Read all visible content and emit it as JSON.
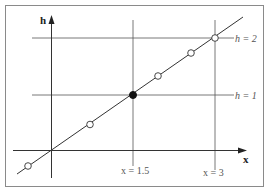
{
  "diagram": {
    "axes": {
      "y_label": "h",
      "x_label": "x"
    },
    "horizontal_lines": [
      {
        "label": "h = 2",
        "value": 2
      },
      {
        "label": "h = 1",
        "value": 1
      }
    ],
    "vertical_lines": [
      {
        "label": "x = 1.5",
        "value": 1.5
      },
      {
        "label": "x = 3",
        "value": 3
      }
    ],
    "line": {
      "description": "straight line h = x/1.5 through origin"
    },
    "points": {
      "filled": [
        {
          "x": 1.5,
          "h": 1
        }
      ],
      "open": [
        {
          "x": -0.4,
          "h": -0.27
        },
        {
          "x": 0.6,
          "h": 0.4
        },
        {
          "x": 2.0,
          "h": 1.33
        },
        {
          "x": 2.5,
          "h": 1.67
        },
        {
          "x": 3.0,
          "h": 2.0
        }
      ]
    },
    "colors": {
      "stroke": "#333333",
      "grid": "#555555",
      "frame": "#888888"
    }
  }
}
